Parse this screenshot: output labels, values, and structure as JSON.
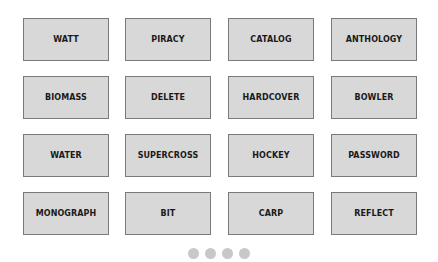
{
  "tiles": [
    {
      "label": "WATT"
    },
    {
      "label": "PIRACY"
    },
    {
      "label": "CATALOG"
    },
    {
      "label": "ANTHOLOGY"
    },
    {
      "label": "BIOMASS"
    },
    {
      "label": "DELETE"
    },
    {
      "label": "HARDCOVER"
    },
    {
      "label": "BOWLER"
    },
    {
      "label": "WATER"
    },
    {
      "label": "SUPERCROSS"
    },
    {
      "label": "HOCKEY"
    },
    {
      "label": "PASSWORD"
    },
    {
      "label": "MONOGRAPH"
    },
    {
      "label": "BIT"
    },
    {
      "label": "CARP"
    },
    {
      "label": "REFLECT"
    }
  ],
  "pagination": {
    "dots": 4
  },
  "colors": {
    "tile_bg": "#d8d8d8",
    "tile_border": "#7a7a7a",
    "dot": "#c8c8c8"
  }
}
